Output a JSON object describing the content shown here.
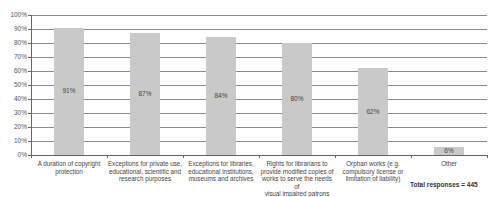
{
  "chart_data": {
    "type": "bar",
    "title": "",
    "xlabel": "",
    "ylabel": "",
    "ylim": [
      0,
      100
    ],
    "yticks": [
      "0%",
      "10%",
      "20%",
      "30%",
      "40%",
      "50%",
      "60%",
      "70%",
      "80%",
      "90%",
      "100%"
    ],
    "grid": true,
    "legend": null,
    "categories": [
      "A duration of copyright\nprotection",
      "Exceptions for private use,\neducational, scientific and\nresearch purposes",
      "Exceptions for libraries,\neducational institutions,\nmuseums and archives",
      "Rights for librarians to\nprovide modified copies of\nworks to serve the needs of\nvisual impaired patrons",
      "Orphan works (e.g.\ncompulsory license or\nlimitation of liability)",
      "Other"
    ],
    "values": [
      91,
      87,
      84,
      80,
      62,
      6
    ],
    "value_labels": [
      "91%",
      "87%",
      "84%",
      "80%",
      "62%",
      "6%"
    ],
    "annotations": [
      "Total responses = 445"
    ],
    "bar_color": "#c9c9c9"
  },
  "total_label": "Total responses = 445"
}
